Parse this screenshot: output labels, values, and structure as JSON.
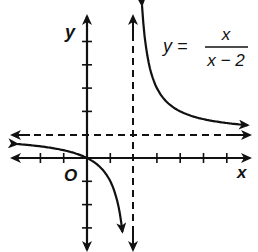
{
  "chart_data": {
    "type": "line",
    "title": "",
    "equation": {
      "lhs": "y =",
      "numerator": "x",
      "denominator": "x − 2"
    },
    "xlabel": "x",
    "ylabel": "y",
    "origin_label": "O",
    "grid": false,
    "xlim": [
      -3,
      7
    ],
    "ylim": [
      -4,
      6
    ],
    "x_ticks": [
      -2,
      -1,
      1,
      2,
      3,
      4,
      5,
      6
    ],
    "y_ticks": [
      -3,
      -2,
      -1,
      1,
      2,
      3,
      4,
      5
    ],
    "asymptotes": [
      {
        "type": "vertical",
        "x": 2,
        "style": "dashed"
      },
      {
        "type": "horizontal",
        "y": 1,
        "style": "dashed"
      }
    ],
    "series": [
      {
        "name": "y = x/(x-2), x < 2",
        "function": "x/(x-2)",
        "x": [
          -3,
          -2,
          -1,
          0,
          0.5,
          1,
          1.25,
          1.4
        ],
        "values": [
          0.6,
          0.5,
          0.33,
          0,
          -0.33,
          -1,
          -1.67,
          -2.33
        ]
      },
      {
        "name": "y = x/(x-2), x > 2",
        "function": "x/(x-2)",
        "x": [
          2.35,
          2.5,
          3,
          4,
          5,
          6,
          7
        ],
        "values": [
          6.7,
          5,
          3,
          2,
          1.67,
          1.5,
          1.4
        ]
      }
    ]
  }
}
